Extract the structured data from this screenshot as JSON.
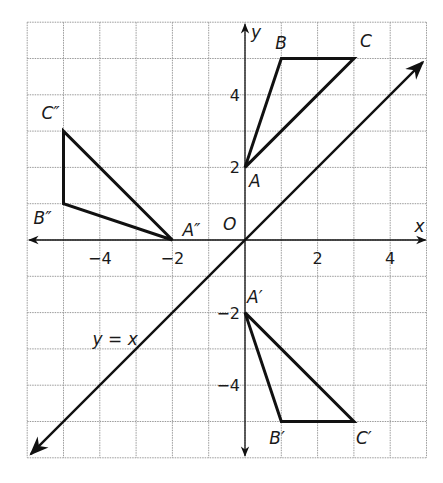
{
  "diagram": {
    "type": "coordinate-plane",
    "x_range": [
      -6,
      5
    ],
    "y_range": [
      -6,
      6
    ],
    "axis_labels": {
      "x": "x",
      "y": "y",
      "origin": "O"
    },
    "x_tick_labels": [
      {
        "v": -4,
        "t": "−4"
      },
      {
        "v": -2,
        "t": "−2"
      },
      {
        "v": 2,
        "t": "2"
      },
      {
        "v": 4,
        "t": "4"
      }
    ],
    "y_tick_labels": [
      {
        "v": 4,
        "t": "4"
      },
      {
        "v": 2,
        "t": "2"
      },
      {
        "v": -2,
        "t": "−2"
      },
      {
        "v": -4,
        "t": "−4"
      }
    ],
    "line": {
      "equation_label": "y = x",
      "slope": 1,
      "intercept": 0
    },
    "triangles": [
      {
        "name": "ABC",
        "vertices": [
          {
            "label": "A",
            "x": 0,
            "y": 2
          },
          {
            "label": "B",
            "x": 1,
            "y": 5
          },
          {
            "label": "C",
            "x": 3,
            "y": 5
          }
        ]
      },
      {
        "name": "A'B'C'",
        "vertices": [
          {
            "label": "A′",
            "x": 0,
            "y": -2
          },
          {
            "label": "B′",
            "x": 1,
            "y": -5
          },
          {
            "label": "C′",
            "x": 3,
            "y": -5
          }
        ]
      },
      {
        "name": "A''B''C''",
        "vertices": [
          {
            "label": "A″",
            "x": -2,
            "y": 0
          },
          {
            "label": "B″",
            "x": -5,
            "y": 1
          },
          {
            "label": "C″",
            "x": -5,
            "y": 3
          }
        ]
      }
    ],
    "colors": {
      "grid": "#9a9a9a",
      "ink": "#111111",
      "background": "#ffffff"
    }
  }
}
